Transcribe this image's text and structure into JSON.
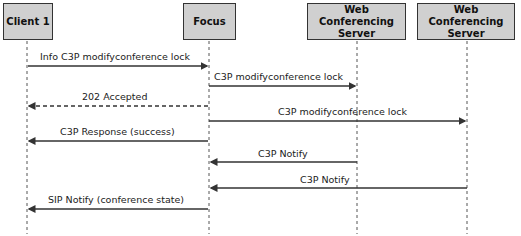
{
  "participants": [
    {
      "id": "client1",
      "label": "Client 1",
      "x": 27
    },
    {
      "id": "focus",
      "label": "Focus",
      "x": 209
    },
    {
      "id": "wcs1",
      "label": "Web Conferencing Server",
      "x": 357
    },
    {
      "id": "wcs2",
      "label": "Web Conferencing Server",
      "x": 467
    }
  ],
  "messages": [
    {
      "label": "Info C3P modifyconference lock",
      "from": "client1",
      "to": "focus",
      "style": "solid"
    },
    {
      "label": "C3P modifyconference lock",
      "from": "focus",
      "to": "wcs1",
      "style": "solid"
    },
    {
      "label": "202 Accepted",
      "from": "focus",
      "to": "client1",
      "style": "dashed"
    },
    {
      "label": "C3P modifyconference lock",
      "from": "focus",
      "to": "wcs2",
      "style": "solid"
    },
    {
      "label": "C3P Response (success)",
      "from": "focus",
      "to": "client1",
      "style": "solid"
    },
    {
      "label": "C3P Notify",
      "from": "wcs1",
      "to": "focus",
      "style": "solid"
    },
    {
      "label": "C3P Notify",
      "from": "wcs2",
      "to": "focus",
      "style": "solid"
    },
    {
      "label": "SIP Notify (conference state)",
      "from": "focus",
      "to": "client1",
      "style": "solid"
    }
  ]
}
